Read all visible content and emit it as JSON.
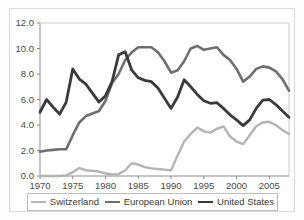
{
  "chart_data": {
    "type": "line",
    "title": "",
    "subtitle": "",
    "xlabel": "",
    "ylabel": "",
    "xlim": [
      1970,
      2008
    ],
    "ylim": [
      0.0,
      12.0
    ],
    "grid": false,
    "legend_position": "bottom",
    "y_ticks": [
      "0.0",
      "2.0",
      "4.0",
      "6.0",
      "8.0",
      "10.0",
      "12.0"
    ],
    "y_tick_values": [
      0.0,
      2.0,
      4.0,
      6.0,
      8.0,
      10.0,
      12.0
    ],
    "x_ticks": [
      "1970",
      "1975",
      "1980",
      "1985",
      "1990",
      "1995",
      "2000",
      "2005"
    ],
    "x_tick_values": [
      1970,
      1975,
      1980,
      1985,
      1990,
      1995,
      2000,
      2005
    ],
    "x": [
      1970,
      1971,
      1972,
      1973,
      1974,
      1975,
      1976,
      1977,
      1978,
      1979,
      1980,
      1981,
      1982,
      1983,
      1984,
      1985,
      1986,
      1987,
      1988,
      1989,
      1990,
      1991,
      1992,
      1993,
      1994,
      1995,
      1996,
      1997,
      1998,
      1999,
      2000,
      2001,
      2002,
      2003,
      2004,
      2005,
      2006,
      2007,
      2008
    ],
    "series": [
      {
        "name": "Switzerland",
        "color": "#b3b3b3",
        "values": [
          0.0,
          0.0,
          0.0,
          0.0,
          0.05,
          0.3,
          0.62,
          0.45,
          0.4,
          0.35,
          0.2,
          0.12,
          0.15,
          0.45,
          1.0,
          0.9,
          0.7,
          0.6,
          0.55,
          0.5,
          0.45,
          1.6,
          2.7,
          3.3,
          3.8,
          3.5,
          3.4,
          3.7,
          3.9,
          3.1,
          2.7,
          2.5,
          3.2,
          3.9,
          4.2,
          4.25,
          4.0,
          3.6,
          3.3
        ]
      },
      {
        "name": "European Union",
        "color": "#6e6e6e",
        "values": [
          1.9,
          2.0,
          2.05,
          2.1,
          2.1,
          3.2,
          4.2,
          4.7,
          4.9,
          5.1,
          5.9,
          7.3,
          8.0,
          9.1,
          9.7,
          10.1,
          10.1,
          10.1,
          9.7,
          9.0,
          8.1,
          8.3,
          9.0,
          10.0,
          10.2,
          9.9,
          10.0,
          10.1,
          9.5,
          9.1,
          8.4,
          7.4,
          7.8,
          8.4,
          8.6,
          8.5,
          8.2,
          7.6,
          6.7
        ]
      },
      {
        "name": "United States",
        "color": "#3a3a3a",
        "values": [
          5.0,
          6.0,
          5.4,
          4.85,
          5.8,
          8.4,
          7.6,
          7.2,
          6.5,
          5.8,
          6.3,
          7.4,
          9.5,
          9.75,
          8.3,
          7.7,
          7.5,
          7.4,
          6.9,
          6.1,
          5.3,
          6.2,
          7.55,
          7.0,
          6.4,
          5.9,
          5.7,
          5.75,
          5.3,
          4.8,
          4.4,
          3.95,
          4.4,
          5.3,
          5.95,
          6.0,
          5.6,
          5.1,
          4.6
        ]
      }
    ]
  },
  "axes": {
    "y_axis_name": "y-axis",
    "x_axis_name": "x-axis"
  },
  "legend": {
    "items": [
      {
        "label": "Switzerland",
        "color": "#b3b3b3",
        "width": "2.4"
      },
      {
        "label": "European Union",
        "color": "#6e6e6e",
        "width": "2.6"
      },
      {
        "label": "United States",
        "color": "#3a3a3a",
        "width": "2.8"
      }
    ]
  }
}
